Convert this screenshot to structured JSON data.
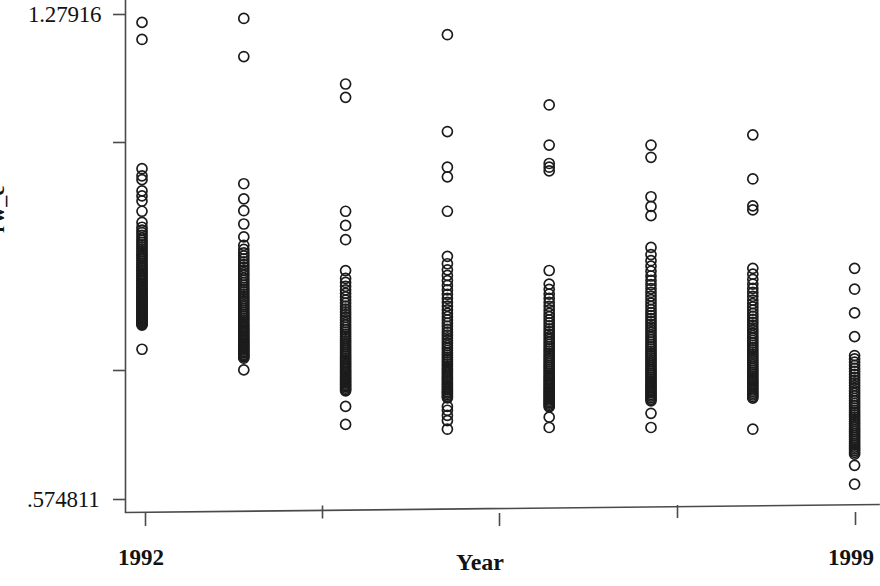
{
  "chart_data": {
    "type": "scatter",
    "title": "",
    "subtitle": "",
    "xlabel": "Year",
    "ylabel": "rw_c",
    "grid": false,
    "legend": null,
    "xlim": [
      1992,
      1999
    ],
    "ylim": [
      0.574811,
      1.27916
    ],
    "x_tick_labels": [
      "1992",
      "1999"
    ],
    "y_tick_labels": [
      "1.27916",
      ".574811"
    ],
    "y_axis_min_label": ".574811",
    "y_axis_max_label": "1.27916",
    "x_axis_min_label": "1992",
    "x_axis_max_label": "1999",
    "marker_style": "open-circle",
    "marker_color": "#1c1c1c",
    "axis_color": "#4a4a4a",
    "note": "Strip/dot plot of rw_c by Year, 1992-1999; each column is one year with heavily overlapping open circles.",
    "categories": [
      1992,
      1993,
      1994,
      1995,
      1996,
      1997,
      1998,
      1999
    ],
    "series": [
      {
        "name": "rw_c",
        "points_by_year": {
          "1992": [
            1.2677,
            1.2429,
            1.0552,
            1.0449,
            1.0393,
            1.023,
            1.0157,
            1.0083,
            0.9934,
            0.9772,
            0.9702,
            0.966,
            0.9622,
            0.9585,
            0.9548,
            0.9514,
            0.9481,
            0.9448,
            0.9416,
            0.9385,
            0.9354,
            0.9324,
            0.9295,
            0.9266,
            0.9238,
            0.921,
            0.9183,
            0.9156,
            0.913,
            0.9104,
            0.9079,
            0.9054,
            0.903,
            0.9006,
            0.8982,
            0.8959,
            0.8936,
            0.8914,
            0.8892,
            0.887,
            0.8849,
            0.8828,
            0.8807,
            0.8787,
            0.8767,
            0.8747,
            0.8728,
            0.8709,
            0.869,
            0.8671,
            0.8653,
            0.8635,
            0.8617,
            0.8599,
            0.8582,
            0.8565,
            0.8548,
            0.8531,
            0.8515,
            0.8499,
            0.8483,
            0.8467,
            0.8451,
            0.8436,
            0.8421,
            0.8406,
            0.8391,
            0.8376,
            0.8362,
            0.8348,
            0.8334,
            0.832,
            0.8306,
            0.8293,
            0.828,
            0.793
          ],
          "1993": [
            1.2734,
            1.2181,
            1.0334,
            1.0115,
            0.9942,
            0.9749,
            0.9562,
            0.944,
            0.938,
            0.933,
            0.9285,
            0.9242,
            0.92,
            0.9159,
            0.9119,
            0.908,
            0.9042,
            0.9005,
            0.8968,
            0.8932,
            0.8897,
            0.8862,
            0.8828,
            0.8795,
            0.8762,
            0.873,
            0.8698,
            0.8667,
            0.8636,
            0.8606,
            0.8576,
            0.8547,
            0.8518,
            0.849,
            0.8462,
            0.8434,
            0.8407,
            0.838,
            0.8354,
            0.8328,
            0.8302,
            0.8277,
            0.8252,
            0.8228,
            0.8204,
            0.818,
            0.8156,
            0.8133,
            0.811,
            0.8087,
            0.8065,
            0.8043,
            0.8021,
            0.8,
            0.7979,
            0.7958,
            0.7937,
            0.7917,
            0.7897,
            0.7877,
            0.7857,
            0.7838,
            0.7819,
            0.78,
            0.763
          ],
          "1994": [
            1.1782,
            1.1589,
            0.9934,
            0.9728,
            0.9521,
            0.9072,
            0.8959,
            0.89,
            0.8845,
            0.8792,
            0.8741,
            0.8692,
            0.8645,
            0.86,
            0.8556,
            0.8513,
            0.8472,
            0.8432,
            0.8393,
            0.8355,
            0.8318,
            0.8282,
            0.8247,
            0.8213,
            0.818,
            0.8147,
            0.8115,
            0.8084,
            0.8053,
            0.8023,
            0.7994,
            0.7965,
            0.7937,
            0.7909,
            0.7882,
            0.7855,
            0.7829,
            0.7803,
            0.7778,
            0.7753,
            0.7728,
            0.7704,
            0.768,
            0.7657,
            0.7634,
            0.7611,
            0.7589,
            0.7567,
            0.7545,
            0.7524,
            0.7503,
            0.7482,
            0.7462,
            0.7442,
            0.7422,
            0.7402,
            0.7383,
            0.7364,
            0.7345,
            0.7327,
            0.71,
            0.6839
          ],
          "1995": [
            1.2498,
            1.1092,
            1.0574,
            1.0433,
            0.9934,
            0.9279,
            0.9172,
            0.9083,
            0.9002,
            0.8927,
            0.8857,
            0.8791,
            0.8728,
            0.8668,
            0.8611,
            0.8556,
            0.8503,
            0.8452,
            0.8403,
            0.8355,
            0.8309,
            0.8264,
            0.822,
            0.8178,
            0.8137,
            0.8097,
            0.8058,
            0.802,
            0.7983,
            0.7947,
            0.7912,
            0.7877,
            0.7844,
            0.7811,
            0.7779,
            0.7747,
            0.7716,
            0.7686,
            0.7656,
            0.7627,
            0.7599,
            0.7571,
            0.7543,
            0.7516,
            0.749,
            0.7464,
            0.7438,
            0.7413,
            0.7388,
            0.7364,
            0.734,
            0.7316,
            0.7293,
            0.727,
            0.7247,
            0.7225,
            0.71,
            0.7044,
            0.6969,
            0.6894,
            0.6769
          ],
          "1996": [
            1.1478,
            1.0896,
            1.0628,
            1.0574,
            1.052,
            0.9074,
            0.8876,
            0.88,
            0.8732,
            0.8669,
            0.861,
            0.8554,
            0.8501,
            0.8451,
            0.8403,
            0.8356,
            0.8312,
            0.8269,
            0.8227,
            0.8187,
            0.8148,
            0.811,
            0.8073,
            0.8037,
            0.8002,
            0.7968,
            0.7935,
            0.7902,
            0.787,
            0.7839,
            0.7809,
            0.7779,
            0.775,
            0.7721,
            0.7693,
            0.7665,
            0.7638,
            0.7611,
            0.7585,
            0.7559,
            0.7534,
            0.7509,
            0.7484,
            0.746,
            0.7436,
            0.7412,
            0.7389,
            0.7366,
            0.7343,
            0.7321,
            0.7299,
            0.7277,
            0.7256,
            0.7234,
            0.7213,
            0.7193,
            0.7172,
            0.7152,
            0.7132,
            0.7112,
            0.7092,
            0.6944,
            0.6794
          ],
          "1997": [
            1.0896,
            1.0718,
            1.0145,
            1.0004,
            0.987,
            0.9409,
            0.9305,
            0.9216,
            0.9136,
            0.9063,
            0.8994,
            0.893,
            0.8869,
            0.8811,
            0.8755,
            0.8702,
            0.8651,
            0.8601,
            0.8553,
            0.8507,
            0.8462,
            0.8418,
            0.8375,
            0.8334,
            0.8293,
            0.8254,
            0.8215,
            0.8177,
            0.814,
            0.8104,
            0.8069,
            0.8034,
            0.8,
            0.7966,
            0.7933,
            0.7901,
            0.7869,
            0.7838,
            0.7807,
            0.7777,
            0.7747,
            0.7718,
            0.7689,
            0.766,
            0.7632,
            0.7604,
            0.7577,
            0.755,
            0.7523,
            0.7497,
            0.7471,
            0.7445,
            0.742,
            0.7395,
            0.737,
            0.7345,
            0.7321,
            0.7297,
            0.7273,
            0.725,
            0.7226,
            0.7203,
            0.718,
            0.7,
            0.6794
          ],
          "1998": [
            1.1044,
            1.0403,
            1.0013,
            0.9954,
            0.9105,
            0.902,
            0.8945,
            0.8877,
            0.8814,
            0.8755,
            0.8699,
            0.8645,
            0.8594,
            0.8545,
            0.8497,
            0.8451,
            0.8407,
            0.8364,
            0.8322,
            0.8281,
            0.8242,
            0.8203,
            0.8165,
            0.8128,
            0.8092,
            0.8057,
            0.8022,
            0.7988,
            0.7955,
            0.7922,
            0.789,
            0.7858,
            0.7827,
            0.7797,
            0.7767,
            0.7737,
            0.7708,
            0.7679,
            0.7651,
            0.7623,
            0.7595,
            0.7568,
            0.7541,
            0.7515,
            0.7489,
            0.7463,
            0.7437,
            0.7412,
            0.7387,
            0.7362,
            0.7338,
            0.7314,
            0.729,
            0.7266,
            0.7243,
            0.722,
            0.6769
          ],
          "1999": [
            0.9105,
            0.8802,
            0.8458,
            0.8114,
            0.7839,
            0.779,
            0.7743,
            0.7697,
            0.7652,
            0.7608,
            0.7565,
            0.7523,
            0.7482,
            0.7442,
            0.7402,
            0.7363,
            0.7325,
            0.7288,
            0.7251,
            0.7215,
            0.7179,
            0.7144,
            0.711,
            0.7076,
            0.7042,
            0.7009,
            0.6977,
            0.6945,
            0.6913,
            0.6882,
            0.6851,
            0.6821,
            0.6791,
            0.6761,
            0.6732,
            0.6703,
            0.6675,
            0.6647,
            0.6619,
            0.6591,
            0.6564,
            0.6537,
            0.651,
            0.6484,
            0.6458,
            0.6432,
            0.6406,
            0.6244,
            0.597
          ]
        }
      }
    ]
  },
  "axes": {
    "y_top_label": "1.27916",
    "y_bottom_label": ".574811",
    "y_title": "rw_c",
    "x_left_label": "1992",
    "x_right_label": "1999",
    "x_title": "Year"
  }
}
